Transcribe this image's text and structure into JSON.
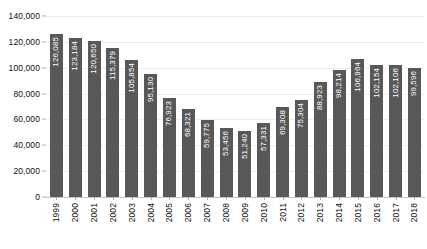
{
  "chart_data": {
    "type": "bar",
    "title": "",
    "xlabel": "",
    "ylabel": "",
    "ylim": [
      0,
      140000
    ],
    "grid": true,
    "legend": false,
    "orientation": "vertical",
    "bar_color": "#585858",
    "value_label_color": "#ffffff",
    "gridline_color": "#ededed",
    "background_color": "#ffffff",
    "categories": [
      "1999",
      "2000",
      "2001",
      "2002",
      "2003",
      "2004",
      "2005",
      "2006",
      "2007",
      "2008",
      "2009",
      "2010",
      "2011",
      "2012",
      "2013",
      "2014",
      "2015",
      "2016",
      "2017",
      "2018"
    ],
    "values": [
      126085,
      123184,
      120650,
      115379,
      105854,
      95130,
      76923,
      68321,
      59775,
      53456,
      51240,
      57331,
      69308,
      75304,
      88923,
      98214,
      106964,
      102154,
      102106,
      99596
    ],
    "value_labels": [
      "126,085",
      "123,184",
      "120,650",
      "115,379",
      "105,854",
      "95,130",
      "76,923",
      "68,321",
      "59,775",
      "53,456",
      "51,240",
      "57,331",
      "69,308",
      "75,304",
      "88,923",
      "98,214",
      "106,964",
      "102,154",
      "102,106",
      "99,596"
    ],
    "yticks": [
      0,
      20000,
      40000,
      60000,
      80000,
      100000,
      120000,
      140000
    ],
    "ytick_labels": [
      "0",
      "20,000",
      "40,000",
      "60,000",
      "80,000",
      "100,000",
      "120,000",
      "140,000"
    ]
  }
}
